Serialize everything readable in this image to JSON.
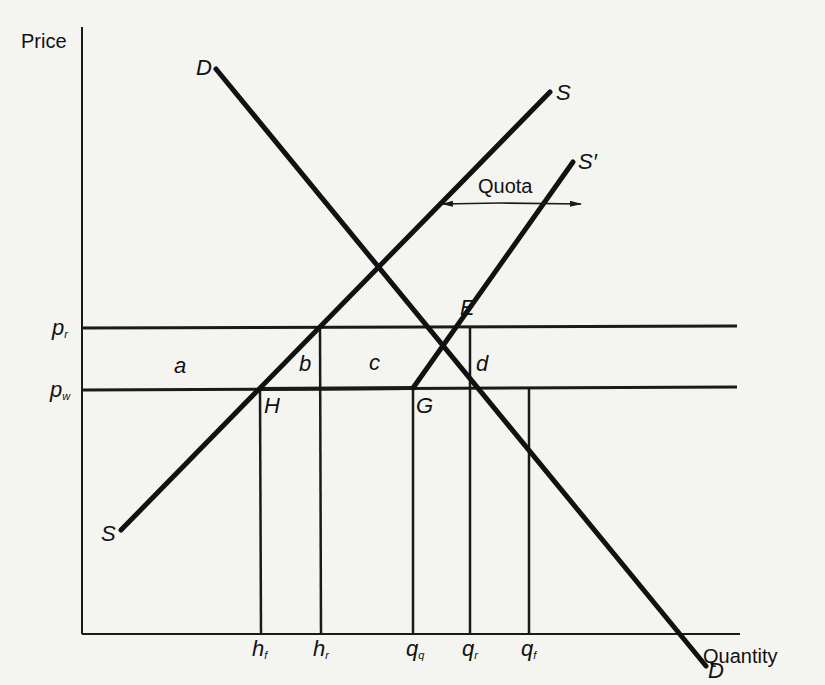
{
  "axes": {
    "y_label": "Price",
    "x_label": "Quantity"
  },
  "curves": {
    "demand_top_label": "D",
    "demand_bottom_label": "D",
    "supply_top_label": "S",
    "supply_bottom_label": "S",
    "supply_shifted_label": "S",
    "supply_shifted_prime": "′"
  },
  "quota": {
    "label": "Quota"
  },
  "prices": {
    "p_r": {
      "base": "p",
      "sub": "r"
    },
    "p_w": {
      "base": "p",
      "sub": "w"
    }
  },
  "quantities": {
    "h_f": {
      "base": "h",
      "sub": "f"
    },
    "h_r": {
      "base": "h",
      "sub": "r"
    },
    "q_q": {
      "base": "q",
      "sub": "q"
    },
    "q_r": {
      "base": "q",
      "sub": "r"
    },
    "q_f": {
      "base": "q",
      "sub": "f"
    }
  },
  "points": {
    "E": "E",
    "H": "H",
    "G": "G"
  },
  "areas": {
    "a": "a",
    "b": "b",
    "c": "c",
    "d": "d"
  }
}
